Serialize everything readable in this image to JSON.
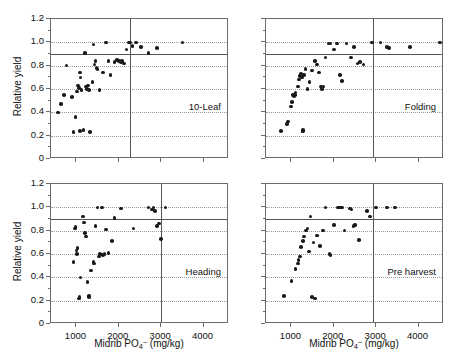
{
  "figure": {
    "axis_x_title_prefix": "Midrib PO",
    "axis_x_title_sub": "4",
    "axis_x_title_sup": "–",
    "axis_x_title_suffix": " (mg/kg)",
    "axis_y_title": "Relative yield",
    "point_color": "#1a1a1a",
    "frame_color": "#6b6b6b",
    "gridline_color": "#9a9a9a",
    "refline_color": "#555555"
  },
  "axes": {
    "x": {
      "min": 400,
      "max": 4600,
      "ticks": [
        1000,
        2000,
        3000,
        4000
      ],
      "tick_labels": [
        "1000",
        "2000",
        "3000",
        "4000"
      ],
      "minor_ticks": [
        500,
        1500,
        2500,
        3500,
        4500
      ]
    },
    "y": {
      "min": 0,
      "max": 1.2,
      "ticks": [
        0,
        0.2,
        0.4,
        0.6,
        0.8,
        1.0,
        1.2
      ],
      "tick_labels": [
        "0",
        "0.2",
        "0.4",
        "0.6",
        "0.8",
        "1.0",
        "1.2"
      ],
      "minor_ticks": [
        0.1,
        0.3,
        0.5,
        0.7,
        0.9,
        1.1
      ],
      "gridlines": [
        0.2,
        0.4,
        0.6,
        0.8,
        1.0
      ]
    }
  },
  "chart_data": {
    "type": "scatter",
    "title": "",
    "xlabel": "Midrib PO4- (mg/kg)",
    "ylabel": "Relative yield",
    "xlim": [
      400,
      4600
    ],
    "ylim": [
      0,
      1.2
    ],
    "grid": true,
    "legend": "none",
    "layout": "2x2 panel grid, shared axes",
    "panels": [
      {
        "label": "10-Leaf",
        "position": "top-left",
        "critical_concentration": 2260,
        "yield_threshold": 0.9,
        "points": [
          [
            560,
            0.4
          ],
          [
            640,
            0.47
          ],
          [
            700,
            0.55
          ],
          [
            770,
            0.8
          ],
          [
            900,
            0.53
          ],
          [
            930,
            0.23
          ],
          [
            980,
            0.36
          ],
          [
            1020,
            0.58
          ],
          [
            1040,
            0.63
          ],
          [
            1060,
            0.61
          ],
          [
            1080,
            0.74
          ],
          [
            1090,
            0.24
          ],
          [
            1100,
            0.7
          ],
          [
            1120,
            0.59
          ],
          [
            1170,
            0.25
          ],
          [
            1200,
            0.91
          ],
          [
            1230,
            0.62
          ],
          [
            1250,
            0.6
          ],
          [
            1280,
            0.63
          ],
          [
            1300,
            0.59
          ],
          [
            1320,
            0.23
          ],
          [
            1380,
            0.66
          ],
          [
            1400,
            0.98
          ],
          [
            1430,
            0.81
          ],
          [
            1450,
            0.84
          ],
          [
            1470,
            0.78
          ],
          [
            1500,
            0.77
          ],
          [
            1540,
            0.59
          ],
          [
            1620,
            0.74
          ],
          [
            1700,
            1.0
          ],
          [
            1760,
            0.84
          ],
          [
            1800,
            0.72
          ],
          [
            1900,
            0.83
          ],
          [
            1960,
            0.85
          ],
          [
            2000,
            0.84
          ],
          [
            2050,
            0.83
          ],
          [
            2080,
            0.84
          ],
          [
            2120,
            0.82
          ],
          [
            2180,
            0.94
          ],
          [
            2230,
            1.0
          ],
          [
            2270,
            1.0
          ],
          [
            2320,
            0.97
          ],
          [
            2400,
            1.0
          ],
          [
            2520,
            0.96
          ],
          [
            2700,
            0.91
          ],
          [
            2900,
            0.95
          ],
          [
            3500,
            1.0
          ]
        ]
      },
      {
        "label": "Folding",
        "position": "top-right",
        "critical_concentration": 2930,
        "yield_threshold": 0.9,
        "points": [
          [
            760,
            0.24
          ],
          [
            900,
            0.3
          ],
          [
            920,
            0.32
          ],
          [
            990,
            0.45
          ],
          [
            1010,
            0.49
          ],
          [
            1040,
            0.55
          ],
          [
            1060,
            0.54
          ],
          [
            1080,
            0.55
          ],
          [
            1100,
            0.57
          ],
          [
            1150,
            0.62
          ],
          [
            1180,
            0.68
          ],
          [
            1200,
            0.71
          ],
          [
            1220,
            0.73
          ],
          [
            1250,
            0.7
          ],
          [
            1260,
            0.24
          ],
          [
            1270,
            0.25
          ],
          [
            1280,
            0.24
          ],
          [
            1300,
            0.72
          ],
          [
            1330,
            0.77
          ],
          [
            1380,
            0.6
          ],
          [
            1430,
            0.66
          ],
          [
            1480,
            0.76
          ],
          [
            1560,
            0.84
          ],
          [
            1600,
            0.81
          ],
          [
            1650,
            0.74
          ],
          [
            1700,
            0.62
          ],
          [
            1720,
            0.6
          ],
          [
            1760,
            0.62
          ],
          [
            1800,
            0.87
          ],
          [
            1870,
            0.99
          ],
          [
            1920,
            0.99
          ],
          [
            2000,
            0.94
          ],
          [
            2080,
            0.99
          ],
          [
            2150,
            0.72
          ],
          [
            2200,
            0.67
          ],
          [
            2300,
            0.99
          ],
          [
            2400,
            0.87
          ],
          [
            2480,
            0.96
          ],
          [
            2560,
            0.82
          ],
          [
            2620,
            0.83
          ],
          [
            2700,
            0.81
          ],
          [
            2900,
            1.0
          ],
          [
            3100,
            1.0
          ],
          [
            3250,
            0.96
          ],
          [
            3300,
            0.95
          ],
          [
            3800,
            0.96
          ],
          [
            4500,
            1.0
          ]
        ]
      },
      {
        "label": "Heading",
        "position": "bottom-left",
        "critical_concentration": 3000,
        "yield_threshold": 0.9,
        "points": [
          [
            930,
            0.53
          ],
          [
            960,
            0.82
          ],
          [
            980,
            0.83
          ],
          [
            1000,
            0.63
          ],
          [
            1010,
            0.6
          ],
          [
            1030,
            0.65
          ],
          [
            1060,
            0.22
          ],
          [
            1070,
            0.23
          ],
          [
            1100,
            0.4
          ],
          [
            1160,
            0.92
          ],
          [
            1180,
            0.87
          ],
          [
            1200,
            0.78
          ],
          [
            1220,
            0.75
          ],
          [
            1260,
            0.36
          ],
          [
            1290,
            0.24
          ],
          [
            1300,
            0.23
          ],
          [
            1350,
            0.46
          ],
          [
            1400,
            0.53
          ],
          [
            1420,
            0.52
          ],
          [
            1450,
            0.84
          ],
          [
            1500,
            1.0
          ],
          [
            1530,
            0.58
          ],
          [
            1560,
            0.6
          ],
          [
            1600,
            1.0
          ],
          [
            1620,
            0.59
          ],
          [
            1660,
            0.6
          ],
          [
            1700,
            0.81
          ],
          [
            1760,
            0.61
          ],
          [
            1840,
            0.71
          ],
          [
            1900,
            0.91
          ],
          [
            2050,
            0.99
          ],
          [
            2350,
            0.82
          ],
          [
            2700,
            1.0
          ],
          [
            2780,
            0.98
          ],
          [
            2820,
            1.0
          ],
          [
            2850,
            0.97
          ],
          [
            2900,
            0.84
          ],
          [
            2950,
            0.86
          ],
          [
            3000,
            0.73
          ],
          [
            3100,
            1.0
          ]
        ]
      },
      {
        "label": "Pre harvest",
        "position": "bottom-right",
        "critical_concentration": 2930,
        "yield_threshold": 0.9,
        "points": [
          [
            830,
            0.24
          ],
          [
            1000,
            0.37
          ],
          [
            1100,
            0.47
          ],
          [
            1150,
            0.52
          ],
          [
            1170,
            0.55
          ],
          [
            1200,
            0.58
          ],
          [
            1230,
            0.66
          ],
          [
            1280,
            0.71
          ],
          [
            1300,
            0.75
          ],
          [
            1340,
            0.8
          ],
          [
            1380,
            0.82
          ],
          [
            1420,
            0.62
          ],
          [
            1450,
            0.92
          ],
          [
            1480,
            0.23
          ],
          [
            1520,
            0.7
          ],
          [
            1560,
            0.22
          ],
          [
            1600,
            0.76
          ],
          [
            1680,
            0.67
          ],
          [
            1750,
            0.8
          ],
          [
            1800,
            1.0
          ],
          [
            1900,
            0.6
          ],
          [
            1920,
            0.59
          ],
          [
            2000,
            0.85
          ],
          [
            2100,
            1.0
          ],
          [
            2150,
            1.0
          ],
          [
            2200,
            1.0
          ],
          [
            2250,
            0.8
          ],
          [
            2380,
            0.99
          ],
          [
            2420,
            0.98
          ],
          [
            2460,
            0.84
          ],
          [
            2500,
            0.85
          ],
          [
            2600,
            0.72
          ],
          [
            2780,
            0.97
          ],
          [
            2850,
            0.92
          ],
          [
            3000,
            1.0
          ],
          [
            3250,
            1.0
          ],
          [
            3450,
            1.0
          ]
        ]
      }
    ]
  }
}
